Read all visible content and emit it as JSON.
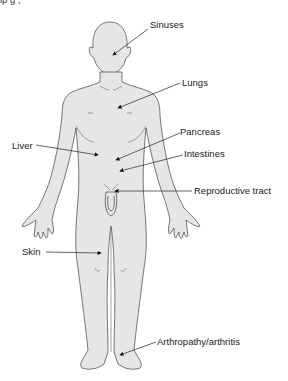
{
  "figure": {
    "caption_fragment": "ip  g                       ,",
    "body_fill": "#e6e6e6",
    "outline_color": "#555555",
    "labels": [
      {
        "id": "sinuses",
        "text": "Sinuses",
        "x": 150,
        "y": 19
      },
      {
        "id": "lungs",
        "text": "Lungs",
        "x": 182,
        "y": 77
      },
      {
        "id": "liver",
        "text": "Liver",
        "x": 12,
        "y": 140
      },
      {
        "id": "pancreas",
        "text": "Pancreas",
        "x": 180,
        "y": 126
      },
      {
        "id": "intestines",
        "text": "Intestines",
        "x": 184,
        "y": 148
      },
      {
        "id": "reproductive",
        "text": "Reproductive tract",
        "x": 194,
        "y": 180
      },
      {
        "id": "skin",
        "text": "Skin",
        "x": 22,
        "y": 242
      },
      {
        "id": "arthropathy",
        "text": "Arthropathy/arthritis",
        "x": 157,
        "y": 336
      }
    ]
  }
}
